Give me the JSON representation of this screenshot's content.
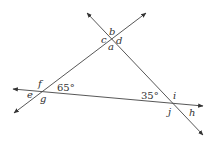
{
  "figure": {
    "angle_labels": {
      "a": "a",
      "b": "b",
      "c": "c",
      "d": "d",
      "e": "e",
      "f": "f",
      "g": "g",
      "h": "h",
      "i": "i",
      "j": "j"
    },
    "angle_measures": {
      "left_vertex": "65°",
      "right_vertex": "35°"
    },
    "colors": {
      "line": "#444444",
      "text": "#333333",
      "background": "#ffffff"
    }
  }
}
